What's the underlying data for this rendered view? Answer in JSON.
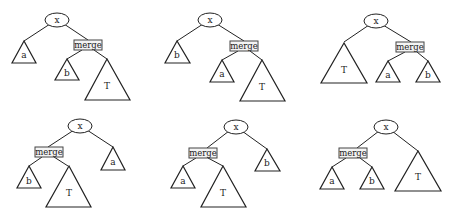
{
  "diagrams": [
    {
      "id": 1,
      "root": "x",
      "merge_label": "merge",
      "left": {
        "label": "a"
      },
      "merge_children": [
        {
          "label": "b"
        },
        {
          "label": "T"
        }
      ]
    },
    {
      "id": 2,
      "root": "x",
      "merge_label": "merge",
      "left": {
        "label": "b"
      },
      "merge_children": [
        {
          "label": "a"
        },
        {
          "label": "T"
        }
      ]
    },
    {
      "id": 3,
      "root": "x",
      "merge_label": "merge",
      "left": {
        "label": "T"
      },
      "merge_children": [
        {
          "label": "a"
        },
        {
          "label": "b"
        }
      ]
    },
    {
      "id": 4,
      "root": "x",
      "merge_label": "merge",
      "merge_children": [
        {
          "label": "b"
        },
        {
          "label": "T"
        }
      ],
      "right": {
        "label": "a"
      }
    },
    {
      "id": 5,
      "root": "x",
      "merge_label": "merge",
      "merge_children": [
        {
          "label": "a"
        },
        {
          "label": "T"
        }
      ],
      "right": {
        "label": "b"
      }
    },
    {
      "id": 6,
      "root": "x",
      "merge_label": "merge",
      "merge_children": [
        {
          "label": "a"
        },
        {
          "label": "b"
        }
      ],
      "right": {
        "label": "T"
      }
    }
  ]
}
